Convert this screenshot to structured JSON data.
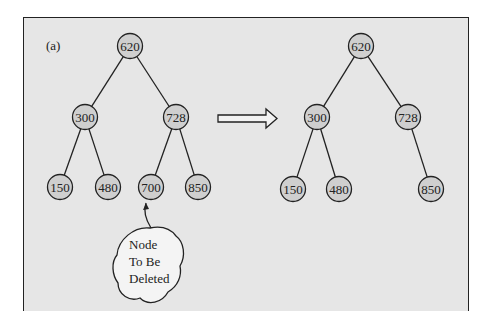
{
  "figure_label": "(a)",
  "before_tree": {
    "nodes": [
      {
        "id": "620",
        "label": "620",
        "x": 130,
        "y": 46
      },
      {
        "id": "300",
        "label": "300",
        "x": 85,
        "y": 117
      },
      {
        "id": "728",
        "label": "728",
        "x": 176,
        "y": 117
      },
      {
        "id": "150",
        "label": "150",
        "x": 60,
        "y": 187
      },
      {
        "id": "480",
        "label": "480",
        "x": 108,
        "y": 187
      },
      {
        "id": "700",
        "label": "700",
        "x": 151,
        "y": 187
      },
      {
        "id": "850",
        "label": "850",
        "x": 198,
        "y": 187
      }
    ],
    "edges": [
      [
        "620",
        "300"
      ],
      [
        "620",
        "728"
      ],
      [
        "300",
        "150"
      ],
      [
        "300",
        "480"
      ],
      [
        "728",
        "700"
      ],
      [
        "728",
        "850"
      ]
    ]
  },
  "after_tree": {
    "nodes": [
      {
        "id": "620",
        "label": "620",
        "x": 361,
        "y": 46
      },
      {
        "id": "300",
        "label": "300",
        "x": 317,
        "y": 117
      },
      {
        "id": "728",
        "label": "728",
        "x": 408,
        "y": 117
      },
      {
        "id": "150",
        "label": "150",
        "x": 293,
        "y": 189
      },
      {
        "id": "480",
        "label": "480",
        "x": 339,
        "y": 189
      },
      {
        "id": "850",
        "label": "850",
        "x": 431,
        "y": 189
      }
    ],
    "edges": [
      [
        "620",
        "300"
      ],
      [
        "620",
        "728"
      ],
      [
        "300",
        "150"
      ],
      [
        "300",
        "480"
      ],
      [
        "728",
        "850"
      ]
    ]
  },
  "callout": {
    "lines": [
      "Node",
      "To Be",
      "Deleted"
    ],
    "points_to": "700"
  },
  "arrow": {
    "direction": "right"
  }
}
